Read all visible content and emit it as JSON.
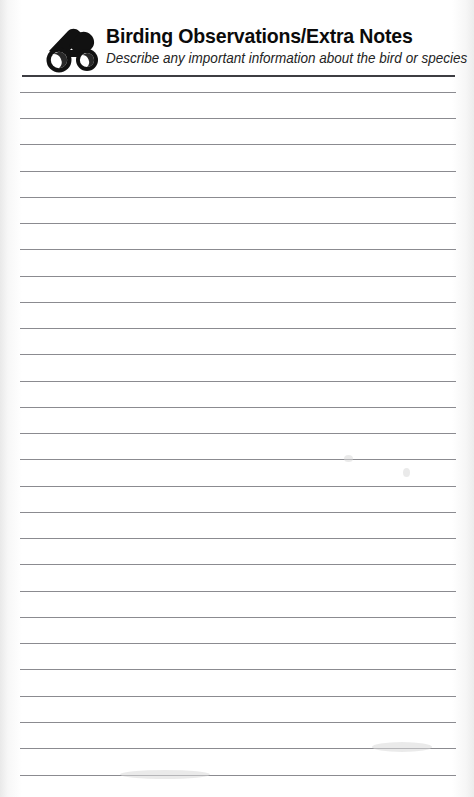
{
  "page": {
    "width": 474,
    "height": 797,
    "background_color": "#ffffff",
    "paper_edge_color": "#ececec"
  },
  "header": {
    "icon": "binoculars-icon",
    "title": "Birding Observations/Extra Notes",
    "subtitle": "Describe any important information about the bird or species",
    "title_color": "#0b0b0b",
    "subtitle_color": "#242424",
    "divider": {
      "color": "#3d3d42",
      "thickness_px": 2,
      "left_px": 22,
      "right_px": 455
    }
  },
  "notes_area": {
    "line_color": "#8b8b90",
    "line_thickness_px": 1,
    "line_count": 27,
    "first_line_y_px": 92,
    "line_spacing_px": 26.2,
    "line_left_px": 20,
    "line_right_px": 456,
    "lines": [
      {
        "index": 1,
        "y": 92,
        "left": 20,
        "right": 456
      },
      {
        "index": 2,
        "y": 118,
        "left": 20,
        "right": 456
      },
      {
        "index": 3,
        "y": 144,
        "left": 20,
        "right": 456
      },
      {
        "index": 4,
        "y": 171,
        "left": 20,
        "right": 456
      },
      {
        "index": 5,
        "y": 197,
        "left": 20,
        "right": 456
      },
      {
        "index": 6,
        "y": 223,
        "left": 20,
        "right": 456
      },
      {
        "index": 7,
        "y": 249,
        "left": 20,
        "right": 456
      },
      {
        "index": 8,
        "y": 276,
        "left": 20,
        "right": 456
      },
      {
        "index": 9,
        "y": 302,
        "left": 20,
        "right": 456
      },
      {
        "index": 10,
        "y": 328,
        "left": 20,
        "right": 456
      },
      {
        "index": 11,
        "y": 354,
        "left": 20,
        "right": 456
      },
      {
        "index": 12,
        "y": 381,
        "left": 20,
        "right": 456
      },
      {
        "index": 13,
        "y": 407,
        "left": 20,
        "right": 456
      },
      {
        "index": 14,
        "y": 433,
        "left": 20,
        "right": 456
      },
      {
        "index": 15,
        "y": 459,
        "left": 20,
        "right": 456
      },
      {
        "index": 16,
        "y": 486,
        "left": 20,
        "right": 456
      },
      {
        "index": 17,
        "y": 512,
        "left": 20,
        "right": 456
      },
      {
        "index": 18,
        "y": 538,
        "left": 20,
        "right": 456
      },
      {
        "index": 19,
        "y": 564,
        "left": 20,
        "right": 456
      },
      {
        "index": 20,
        "y": 591,
        "left": 20,
        "right": 456
      },
      {
        "index": 21,
        "y": 617,
        "left": 20,
        "right": 456
      },
      {
        "index": 22,
        "y": 643,
        "left": 20,
        "right": 456
      },
      {
        "index": 23,
        "y": 669,
        "left": 20,
        "right": 456
      },
      {
        "index": 24,
        "y": 696,
        "left": 20,
        "right": 456
      },
      {
        "index": 25,
        "y": 722,
        "left": 20,
        "right": 456
      },
      {
        "index": 26,
        "y": 748,
        "left": 20,
        "right": 456
      },
      {
        "index": 27,
        "y": 775,
        "left": 20,
        "right": 456
      }
    ],
    "written_text": []
  },
  "artifacts": {
    "smudges": [
      {
        "x": 344,
        "y": 455,
        "w": 9,
        "h": 7
      },
      {
        "x": 403,
        "y": 468,
        "w": 7,
        "h": 9
      },
      {
        "x": 372,
        "y": 742,
        "w": 60,
        "h": 10
      },
      {
        "x": 120,
        "y": 770,
        "w": 90,
        "h": 9
      }
    ]
  }
}
